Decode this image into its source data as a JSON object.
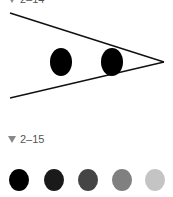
{
  "figure1": {
    "label": "2–14",
    "marker_icon": "triangle-down-icon",
    "lines": [
      {
        "x1": 10,
        "y1": 13,
        "x2": 164,
        "y2": 62
      },
      {
        "x1": 10,
        "y1": 98,
        "x2": 164,
        "y2": 62
      }
    ],
    "ellipses": [
      {
        "cx": 61,
        "cy": 62,
        "rx": 11,
        "ry": 14,
        "fill": "#000000"
      },
      {
        "cx": 112,
        "cy": 62,
        "rx": 11,
        "ry": 14,
        "fill": "#000000"
      }
    ]
  },
  "figure2": {
    "label": "2–15",
    "marker_icon": "triangle-down-icon",
    "circles": [
      {
        "cx": 19,
        "cy": 180,
        "fill": "#000000"
      },
      {
        "cx": 54,
        "cy": 180,
        "fill": "#1a1a1a"
      },
      {
        "cx": 88,
        "cy": 180,
        "fill": "#454545"
      },
      {
        "cx": 122,
        "cy": 180,
        "fill": "#808080"
      },
      {
        "cx": 155,
        "cy": 180,
        "fill": "#c4c4c4"
      }
    ]
  }
}
